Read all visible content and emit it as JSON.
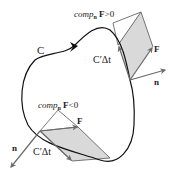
{
  "figure": {
    "type": "diagram",
    "colors": {
      "curve": "#111111",
      "vector": "#6b6b6b",
      "parallelogram_fill": "#d9d9d9",
      "parallelogram_edge": "#555555",
      "text": "#222222"
    }
  },
  "labels": {
    "curve": "C",
    "top": {
      "comp_prefix": "comp",
      "comp_sub": "n",
      "comp_suffix_bold": "F",
      "comp_relation": ">0",
      "F": "F",
      "n": "n",
      "tangent": "C′Δt"
    },
    "bottom": {
      "comp_prefix": "comp",
      "comp_sub": "n",
      "comp_suffix_bold": "F",
      "comp_relation": "<0",
      "F": "F",
      "n": "n",
      "tangent": "C′Δt"
    }
  }
}
